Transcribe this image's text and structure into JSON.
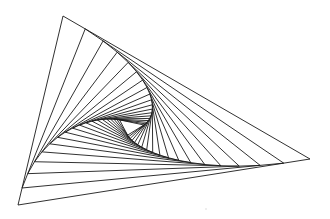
{
  "figure": {
    "type": "nested-rotated-triangles",
    "width": 330,
    "height": 219,
    "background": "#ffffff",
    "stroke_color": "#1a1a1a",
    "outer_triangle": {
      "vertices": [
        [
          63,
          16
        ],
        [
          310,
          159
        ],
        [
          18,
          205
        ]
      ]
    },
    "step_fraction": 0.09,
    "iterations": 18,
    "stray_mark": [
      206,
      209
    ]
  }
}
